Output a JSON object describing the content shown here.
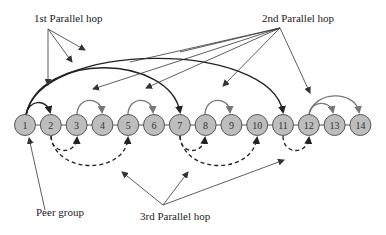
{
  "labels": {
    "first_hop": "1st Parallel hop",
    "second_hop": "2nd Parallel hop",
    "third_hop": "3rd Parallel hop",
    "peer_group": "Peer group"
  },
  "nodes": [
    "1",
    "2",
    "3",
    "4",
    "5",
    "6",
    "7",
    "8",
    "9",
    "10",
    "11",
    "12",
    "13",
    "14"
  ],
  "colors": {
    "node_fill": "#bdbdbd",
    "node_stroke": "#555555",
    "first_hop_arc": "#222222",
    "second_hop_arc": "#777777",
    "third_hop_arc": "#222222",
    "background": "#ffffff"
  },
  "hops": {
    "first": [
      [
        "1",
        "2"
      ],
      [
        "1",
        "7"
      ],
      [
        "1",
        "11"
      ]
    ],
    "second": [
      [
        "3",
        "4"
      ],
      [
        "5",
        "6"
      ],
      [
        "8",
        "9"
      ],
      [
        "12",
        "13"
      ],
      [
        "12",
        "14"
      ]
    ],
    "third": [
      [
        "2",
        "3"
      ],
      [
        "2",
        "5"
      ],
      [
        "7",
        "8"
      ],
      [
        "7",
        "10"
      ],
      [
        "11",
        "12"
      ]
    ]
  }
}
